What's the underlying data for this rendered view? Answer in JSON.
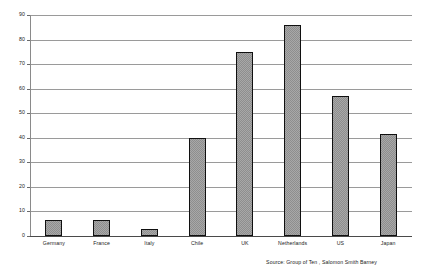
{
  "chart_data": {
    "type": "bar",
    "title": "",
    "subtitle": "",
    "xlabel": "",
    "ylabel": "",
    "categories": [
      "Germany",
      "France",
      "Italy",
      "Chile",
      "UK",
      "Netherlands",
      "US",
      "Japan"
    ],
    "values": [
      6.5,
      6.5,
      3,
      40,
      75,
      86,
      57,
      41.5
    ],
    "series": [
      {
        "name": "",
        "values": [
          6.5,
          6.5,
          3,
          40,
          75,
          86,
          57,
          41.5
        ]
      }
    ],
    "ylim": [
      0,
      90
    ],
    "ytick_labels": [
      "0",
      "10",
      "20",
      "30",
      "40",
      "50",
      "60",
      "70",
      "80",
      "90"
    ],
    "ytick_values": [
      0,
      10,
      20,
      30,
      40,
      50,
      60,
      70,
      80,
      90
    ],
    "grid": true,
    "grid_axis": "y",
    "legend": false,
    "legend_position": "none",
    "annotations": [
      "Source: Group of Ten ,  Salomon Smith Barney"
    ],
    "bar_fill_color": "#a8a8a8",
    "bar_edge_color": "#101010",
    "grid_color": "#9a9a9a",
    "axis_color": "#4a4a4a",
    "background_color": "#ffffff"
  },
  "footer": {
    "source": "Source: Group of Ten ,  Salomon Smith Barney"
  }
}
